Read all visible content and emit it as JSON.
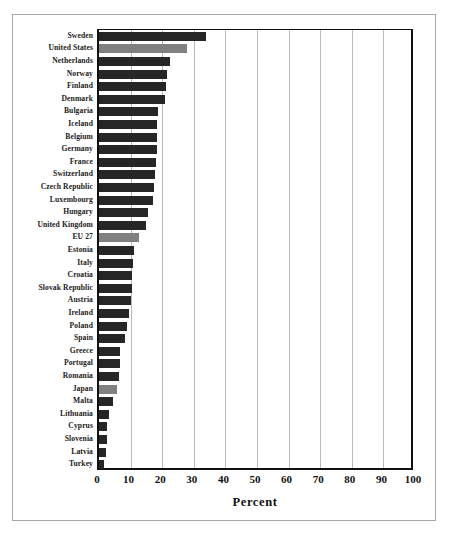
{
  "chart_data": {
    "type": "bar",
    "orientation": "horizontal",
    "title": "",
    "xlabel": "Percent",
    "ylabel": "",
    "xlim": [
      0,
      100
    ],
    "xticks": [
      0,
      10,
      20,
      30,
      40,
      50,
      60,
      70,
      80,
      90,
      100
    ],
    "grid": "vertical",
    "legend": "none",
    "colors": {
      "bar_default": "#262626",
      "bar_highlight": "#808080",
      "axis": "#111111",
      "gridline": "#b9b9b9",
      "frame": "#a8a8a8",
      "background": "#ffffff"
    },
    "categories": [
      "Sweden",
      "United States",
      "Netherlands",
      "Norway",
      "Finland",
      "Denmark",
      "Bulgaria",
      "Iceland",
      "Belgium",
      "Germany",
      "France",
      "Switzerland",
      "Czech Republic",
      "Luxembourg",
      "Hungary",
      "United Kingdom",
      "EU 27",
      "Estonia",
      "Italy",
      "Croatia",
      "Slovak Republic",
      "Austria",
      "Ireland",
      "Poland",
      "Spain",
      "Greece",
      "Portugal",
      "Romania",
      "Japan",
      "Malta",
      "Lithuania",
      "Cyprus",
      "Slovenia",
      "Latvia",
      "Turkey"
    ],
    "values": [
      34.0,
      27.8,
      22.5,
      21.5,
      21.3,
      21.0,
      18.8,
      18.5,
      18.3,
      18.2,
      18.0,
      17.8,
      17.5,
      17.0,
      15.6,
      14.8,
      12.8,
      11.0,
      10.9,
      10.6,
      10.3,
      10.0,
      9.6,
      9.0,
      8.2,
      6.8,
      6.5,
      6.2,
      5.6,
      4.5,
      3.2,
      2.6,
      2.4,
      2.1,
      1.6
    ],
    "highlighted": [
      "United States",
      "EU 27",
      "Japan"
    ]
  }
}
